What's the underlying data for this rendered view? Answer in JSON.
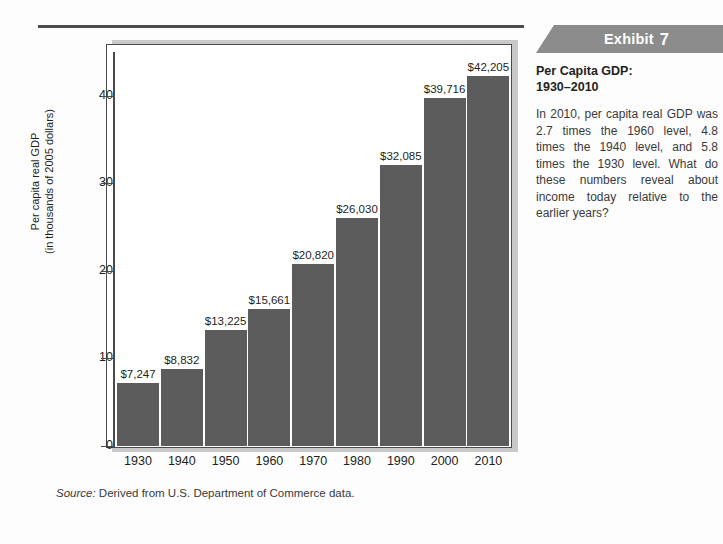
{
  "exhibit": {
    "label": "Exhibit",
    "number": "7"
  },
  "side": {
    "title_line1": "Per Capita GDP:",
    "title_line2": "1930–2010",
    "body": "In 2010, per capita real GDP was 2.7 times the 1960 level, 4.8 times the 1940 level, and 5.8 times the 1930 level. What do these numbers reveal about income today rela­tive to the earlier years?"
  },
  "source": {
    "prefix": "Source:",
    "text": "Derived from U.S. Department of Commerce data."
  },
  "chart_data": {
    "type": "bar",
    "title": "Per Capita GDP: 1930–2010",
    "xlabel": "",
    "ylabel": "Per capita real GDP (in thousands of 2005 dollars)",
    "ylabel_line1": "Per capita real GDP",
    "ylabel_line2": "(in thousands of 2005 dollars)",
    "categories": [
      "1930",
      "1940",
      "1950",
      "1960",
      "1970",
      "1980",
      "1990",
      "2000",
      "2010"
    ],
    "values": [
      7.247,
      8.832,
      13.225,
      15.661,
      20.82,
      26.03,
      32.085,
      39.716,
      42.205
    ],
    "data_labels": [
      "$7,247",
      "$8,832",
      "$13,225",
      "$15,661",
      "$20,820",
      "$26,030",
      "$32,085",
      "$39,716",
      "$42,205"
    ],
    "ylim": [
      0,
      45
    ],
    "yticks": [
      0,
      10,
      20,
      30,
      40
    ],
    "ytick_labels": [
      "0",
      "10",
      "20",
      "30",
      "40"
    ],
    "grid": false,
    "legend": false,
    "bar_color": "#5c5c5c",
    "units": "thousands of 2005 dollars"
  },
  "colors": {
    "bar": "#5c5c5c",
    "banner": "#8c8c8c",
    "frame": "#4a4a4a",
    "shadow": "#c9c9c9",
    "text": "#231f20"
  }
}
